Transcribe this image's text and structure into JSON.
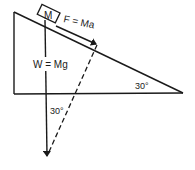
{
  "diagram": {
    "type": "inclined-plane-free-body",
    "block_label": "M",
    "force_label": "F = Ma",
    "weight_label": "W = Mg",
    "incline_angle_label": "30°",
    "vector_angle_label": "30°",
    "colors": {
      "stroke": "#1a1a1a",
      "background": "#ffffff"
    }
  }
}
